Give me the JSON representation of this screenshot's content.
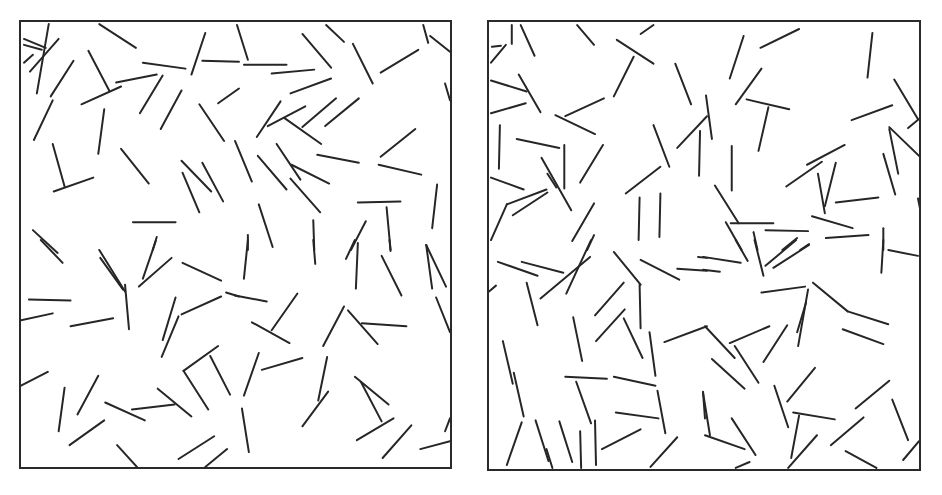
{
  "figure": {
    "line_color": "#262626",
    "border_color": "#2a2a2a",
    "background": "#ffffff"
  },
  "chart_data": [
    {
      "type": "scatter",
      "title": "",
      "panel": "left",
      "frame": {
        "x": 19,
        "y": 20,
        "width": 433,
        "height": 449
      },
      "grid": false,
      "segments": [
        [
          79,
          2,
          116,
          26
        ],
        [
          123,
          41,
          166,
          47
        ],
        [
          186,
          11,
          172,
          53
        ],
        [
          183,
          39,
          220,
          40
        ],
        [
          28,
          2,
          16,
          72
        ],
        [
          3,
          17,
          25,
          26
        ],
        [
          3,
          23,
          21,
          28
        ],
        [
          38,
          17,
          9,
          50
        ],
        [
          12,
          33,
          3,
          41
        ],
        [
          53,
          39,
          30,
          75
        ],
        [
          68,
          29,
          89,
          69
        ],
        [
          61,
          83,
          101,
          65
        ],
        [
          96,
          61,
          137,
          53
        ],
        [
          143,
          54,
          120,
          92
        ],
        [
          162,
          69,
          141,
          108
        ],
        [
          32,
          79,
          13,
          119
        ],
        [
          84,
          88,
          78,
          133
        ],
        [
          180,
          83,
          205,
          120
        ],
        [
          199,
          82,
          220,
          67
        ],
        [
          32,
          123,
          44,
          166
        ],
        [
          33,
          171,
          73,
          157
        ],
        [
          101,
          128,
          129,
          163
        ],
        [
          162,
          140,
          192,
          171
        ],
        [
          183,
          142,
          204,
          181
        ],
        [
          163,
          152,
          180,
          192
        ],
        [
          113,
          202,
          156,
          202
        ],
        [
          12,
          210,
          37,
          233
        ],
        [
          137,
          217,
          133,
          230
        ],
        [
          218,
          3,
          229,
          38
        ],
        [
          225,
          43,
          268,
          43
        ],
        [
          253,
          52,
          296,
          48
        ],
        [
          284,
          12,
          313,
          46
        ],
        [
          308,
          3,
          326,
          20
        ],
        [
          335,
          22,
          355,
          62
        ],
        [
          363,
          51,
          401,
          28
        ],
        [
          406,
          3,
          411,
          21
        ],
        [
          413,
          14,
          433,
          30
        ],
        [
          428,
          62,
          433,
          79
        ],
        [
          272,
          72,
          313,
          57
        ],
        [
          262,
          80,
          238,
          116
        ],
        [
          249,
          105,
          287,
          85
        ],
        [
          284,
          106,
          318,
          77
        ],
        [
          307,
          105,
          341,
          77
        ],
        [
          266,
          97,
          303,
          123
        ],
        [
          216,
          120,
          233,
          161
        ],
        [
          239,
          135,
          268,
          169
        ],
        [
          258,
          123,
          282,
          159
        ],
        [
          273,
          144,
          311,
          163
        ],
        [
          272,
          158,
          302,
          192
        ],
        [
          299,
          134,
          341,
          142
        ],
        [
          363,
          136,
          398,
          108
        ],
        [
          361,
          144,
          404,
          154
        ],
        [
          340,
          182,
          383,
          181
        ],
        [
          369,
          187,
          373,
          230
        ],
        [
          420,
          164,
          415,
          208
        ],
        [
          240,
          184,
          254,
          227
        ],
        [
          295,
          200,
          296,
          230
        ],
        [
          229,
          215,
          229,
          230
        ],
        [
          348,
          201,
          333,
          230
        ],
        [
          20,
          220,
          42,
          243
        ],
        [
          79,
          230,
          105,
          272
        ],
        [
          80,
          238,
          103,
          270
        ],
        [
          105,
          265,
          109,
          310
        ],
        [
          136,
          221,
          123,
          259
        ],
        [
          152,
          238,
          119,
          267
        ],
        [
          163,
          243,
          202,
          261
        ],
        [
          207,
          273,
          220,
          277
        ],
        [
          8,
          280,
          50,
          281
        ],
        [
          0,
          301,
          32,
          294
        ],
        [
          50,
          307,
          93,
          299
        ],
        [
          156,
          278,
          143,
          321
        ],
        [
          159,
          297,
          142,
          338
        ],
        [
          162,
          295,
          202,
          277
        ],
        [
          0,
          367,
          27,
          353
        ],
        [
          199,
          327,
          164,
          352
        ],
        [
          164,
          352,
          189,
          391
        ],
        [
          191,
          337,
          211,
          376
        ],
        [
          44,
          369,
          38,
          413
        ],
        [
          78,
          357,
          57,
          396
        ],
        [
          85,
          384,
          125,
          402
        ],
        [
          112,
          391,
          155,
          386
        ],
        [
          138,
          370,
          172,
          398
        ],
        [
          84,
          402,
          49,
          427
        ],
        [
          97,
          427,
          117,
          449
        ],
        [
          195,
          418,
          159,
          441
        ],
        [
          208,
          431,
          186,
          449
        ],
        [
          229,
          220,
          225,
          259
        ],
        [
          295,
          220,
          297,
          244
        ],
        [
          337,
          220,
          328,
          239
        ],
        [
          340,
          223,
          338,
          269
        ],
        [
          364,
          236,
          384,
          276
        ],
        [
          372,
          220,
          373,
          231
        ],
        [
          409,
          225,
          415,
          269
        ],
        [
          409,
          225,
          429,
          267
        ],
        [
          419,
          278,
          433,
          313
        ],
        [
          216,
          276,
          248,
          282
        ],
        [
          279,
          274,
          253,
          311
        ],
        [
          233,
          303,
          271,
          324
        ],
        [
          326,
          287,
          305,
          327
        ],
        [
          330,
          291,
          360,
          325
        ],
        [
          344,
          304,
          389,
          307
        ],
        [
          240,
          334,
          225,
          377
        ],
        [
          243,
          351,
          284,
          339
        ],
        [
          309,
          338,
          300,
          382
        ],
        [
          310,
          373,
          284,
          408
        ],
        [
          337,
          358,
          371,
          386
        ],
        [
          343,
          363,
          364,
          403
        ],
        [
          376,
          400,
          339,
          422
        ],
        [
          394,
          407,
          365,
          440
        ],
        [
          223,
          390,
          230,
          434
        ],
        [
          403,
          431,
          433,
          423
        ],
        [
          433,
          400,
          428,
          413
        ]
      ]
    },
    {
      "type": "scatter",
      "title": "",
      "panel": "right",
      "frame": {
        "x": 487,
        "y": 20,
        "width": 434,
        "height": 451
      },
      "grid": false,
      "segments": [
        [
          23,
          3,
          23,
          22
        ],
        [
          32,
          3,
          46,
          34
        ],
        [
          89,
          3,
          106,
          23
        ],
        [
          153,
          12,
          166,
          3
        ],
        [
          129,
          18,
          166,
          42
        ],
        [
          146,
          35,
          126,
          75
        ],
        [
          3,
          25,
          12,
          24
        ],
        [
          17,
          23,
          2,
          41
        ],
        [
          2,
          59,
          38,
          70
        ],
        [
          30,
          53,
          52,
          91
        ],
        [
          2,
          92,
          37,
          82
        ],
        [
          116,
          77,
          77,
          95
        ],
        [
          67,
          94,
          107,
          113
        ],
        [
          188,
          42,
          204,
          83
        ],
        [
          11,
          104,
          10,
          148
        ],
        [
          28,
          118,
          71,
          127
        ],
        [
          76,
          124,
          76,
          168
        ],
        [
          115,
          124,
          92,
          162
        ],
        [
          53,
          137,
          83,
          190
        ],
        [
          59,
          153,
          68,
          167
        ],
        [
          166,
          104,
          182,
          146
        ],
        [
          220,
          95,
          190,
          127
        ],
        [
          213,
          110,
          212,
          155
        ],
        [
          2,
          157,
          35,
          169
        ],
        [
          58,
          169,
          18,
          184
        ],
        [
          59,
          172,
          24,
          195
        ],
        [
          18,
          184,
          2,
          220
        ],
        [
          173,
          146,
          138,
          173
        ],
        [
          152,
          177,
          151,
          220
        ],
        [
          173,
          173,
          172,
          217
        ],
        [
          106,
          183,
          84,
          221
        ],
        [
          106,
          215,
          99,
          230
        ],
        [
          257,
          14,
          243,
          57
        ],
        [
          313,
          7,
          274,
          26
        ],
        [
          387,
          11,
          382,
          56
        ],
        [
          275,
          47,
          249,
          83
        ],
        [
          260,
          78,
          303,
          88
        ],
        [
          282,
          86,
          272,
          130
        ],
        [
          219,
          74,
          225,
          118
        ],
        [
          409,
          58,
          433,
          98
        ],
        [
          407,
          84,
          366,
          99
        ],
        [
          435,
          97,
          423,
          107
        ],
        [
          404,
          106,
          434,
          135
        ],
        [
          404,
          108,
          413,
          153
        ],
        [
          398,
          133,
          410,
          174
        ],
        [
          245,
          125,
          245,
          170
        ],
        [
          359,
          124,
          321,
          144
        ],
        [
          336,
          141,
          300,
          166
        ],
        [
          332,
          153,
          339,
          193
        ],
        [
          350,
          142,
          339,
          186
        ],
        [
          350,
          182,
          393,
          177
        ],
        [
          228,
          165,
          252,
          203
        ],
        [
          244,
          203,
          287,
          203
        ],
        [
          326,
          196,
          367,
          208
        ],
        [
          279,
          210,
          322,
          211
        ],
        [
          340,
          218,
          383,
          215
        ],
        [
          398,
          208,
          398,
          230
        ],
        [
          239,
          202,
          255,
          230
        ],
        [
          267,
          212,
          271,
          230
        ],
        [
          311,
          218,
          296,
          230
        ],
        [
          323,
          224,
          314,
          230
        ],
        [
          433,
          178,
          436,
          193
        ],
        [
          9,
          242,
          49,
          256
        ],
        [
          33,
          242,
          75,
          253
        ],
        [
          103,
          220,
          78,
          274
        ],
        [
          102,
          237,
          52,
          279
        ],
        [
          126,
          232,
          153,
          265
        ],
        [
          153,
          240,
          192,
          260
        ],
        [
          190,
          249,
          220,
          251
        ],
        [
          211,
          237,
          220,
          238
        ],
        [
          0,
          272,
          7,
          266
        ],
        [
          38,
          263,
          49,
          306
        ],
        [
          152,
          265,
          153,
          309
        ],
        [
          136,
          263,
          107,
          296
        ],
        [
          137,
          290,
          108,
          322
        ],
        [
          136,
          299,
          155,
          339
        ],
        [
          85,
          298,
          94,
          342
        ],
        [
          162,
          313,
          168,
          357
        ],
        [
          177,
          323,
          220,
          307
        ],
        [
          14,
          322,
          24,
          365
        ],
        [
          25,
          354,
          35,
          398
        ],
        [
          77,
          358,
          119,
          360
        ],
        [
          126,
          358,
          168,
          367
        ],
        [
          88,
          363,
          103,
          405
        ],
        [
          170,
          372,
          178,
          415
        ],
        [
          128,
          394,
          171,
          400
        ],
        [
          33,
          404,
          18,
          447
        ],
        [
          47,
          402,
          60,
          443
        ],
        [
          58,
          431,
          64,
          450
        ],
        [
          71,
          403,
          84,
          444
        ],
        [
          92,
          413,
          93,
          450
        ],
        [
          107,
          402,
          108,
          447
        ],
        [
          153,
          411,
          114,
          431
        ],
        [
          190,
          419,
          163,
          449
        ],
        [
          216,
          373,
          218,
          400
        ],
        [
          249,
          220,
          261,
          241
        ],
        [
          268,
          220,
          277,
          256
        ],
        [
          310,
          220,
          279,
          246
        ],
        [
          323,
          225,
          287,
          248
        ],
        [
          216,
          237,
          254,
          243
        ],
        [
          216,
          250,
          233,
          252
        ],
        [
          398,
          220,
          396,
          253
        ],
        [
          403,
          230,
          433,
          236
        ],
        [
          275,
          273,
          319,
          267
        ],
        [
          322,
          270,
          312,
          327
        ],
        [
          320,
          283,
          311,
          313
        ],
        [
          327,
          263,
          362,
          292
        ],
        [
          362,
          292,
          403,
          305
        ],
        [
          357,
          310,
          398,
          325
        ],
        [
          218,
          307,
          248,
          339
        ],
        [
          243,
          324,
          283,
          307
        ],
        [
          301,
          306,
          277,
          343
        ],
        [
          248,
          327,
          272,
          364
        ],
        [
          225,
          340,
          258,
          370
        ],
        [
          329,
          349,
          301,
          383
        ],
        [
          404,
          362,
          370,
          390
        ],
        [
          288,
          367,
          302,
          409
        ],
        [
          307,
          394,
          349,
          401
        ],
        [
          313,
          397,
          305,
          440
        ],
        [
          378,
          399,
          345,
          427
        ],
        [
          407,
          381,
          423,
          422
        ],
        [
          216,
          374,
          223,
          417
        ],
        [
          218,
          417,
          258,
          431
        ],
        [
          245,
          400,
          269,
          437
        ],
        [
          331,
          417,
          302,
          450
        ],
        [
          360,
          433,
          391,
          450
        ],
        [
          434,
          423,
          418,
          442
        ],
        [
          263,
          444,
          249,
          450
        ]
      ]
    }
  ]
}
